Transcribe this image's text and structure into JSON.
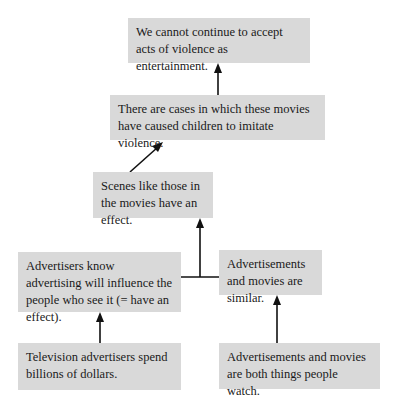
{
  "diagram": {
    "type": "argument-map",
    "colors": {
      "box_fill": "#d9d9d9",
      "text": "#1a1a1a",
      "arrow": "#111111",
      "background": "#ffffff"
    },
    "nodes": [
      {
        "id": "n1",
        "text": "We cannot continue to accept acts of violence as entertainment."
      },
      {
        "id": "n2",
        "text": "There are cases in which these movies have caused children to imitate violence."
      },
      {
        "id": "n3",
        "text": "Scenes like those in the movies have an effect."
      },
      {
        "id": "n4",
        "text": "Advertisers know advertising will influence the people who see it (= have an effect)."
      },
      {
        "id": "n5",
        "text": "Advertisements and movies are similar."
      },
      {
        "id": "n6",
        "text": "Television advertisers spend billions of dollars."
      },
      {
        "id": "n7",
        "text": "Advertisements and movies are both things people watch."
      }
    ],
    "edges": [
      {
        "from": "n2",
        "to": "n1"
      },
      {
        "from": "n3",
        "to": "n2"
      },
      {
        "from": [
          "n4",
          "n5"
        ],
        "to": "n3",
        "linked": true
      },
      {
        "from": "n6",
        "to": "n4"
      },
      {
        "from": "n7",
        "to": "n5"
      }
    ]
  }
}
